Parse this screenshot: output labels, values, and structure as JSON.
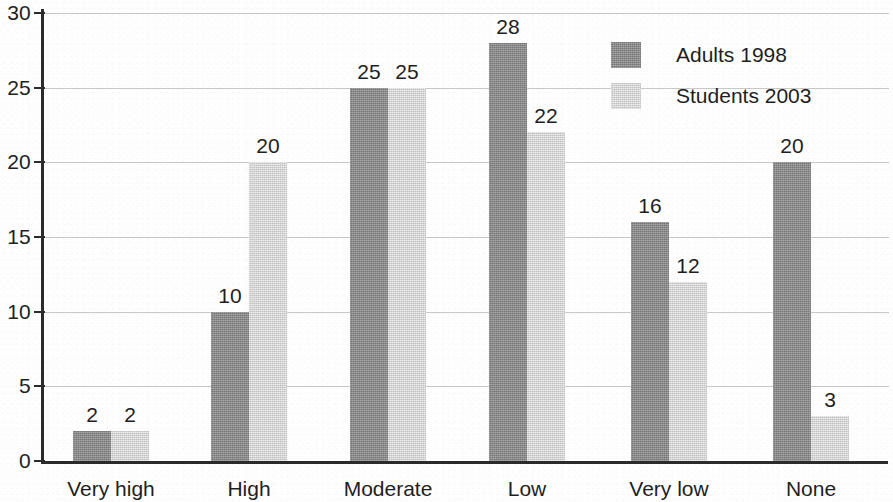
{
  "chart_data": {
    "type": "bar",
    "title": "",
    "xlabel": "",
    "ylabel": "",
    "grid": true,
    "legend_position": "top-right",
    "ylim": [
      0,
      30
    ],
    "yticks": [
      0,
      5,
      10,
      15,
      20,
      25,
      30
    ],
    "ytick_labels": [
      "0",
      "5",
      "10",
      "15",
      "20",
      "25",
      "30"
    ],
    "categories": [
      "Very high",
      "High",
      "Moderate",
      "Low",
      "Very low",
      "None"
    ],
    "series": [
      {
        "name": "Adults 1998",
        "color": "#8d8d8d",
        "values": [
          2,
          10,
          25,
          28,
          16,
          20
        ],
        "value_labels": [
          "2",
          "10",
          "25",
          "28",
          "16",
          "20"
        ]
      },
      {
        "name": "Students 2003",
        "color": "#dcdcdc",
        "values": [
          2,
          20,
          25,
          22,
          12,
          3
        ],
        "value_labels": [
          "2",
          "20",
          "25",
          "22",
          "12",
          "3"
        ]
      }
    ]
  },
  "axis": {
    "line_color": "#2b2b2b",
    "gridline_color": "#c9c9c9"
  },
  "legend": {
    "entries": [
      {
        "label": "Adults 1998",
        "swatch": "dark"
      },
      {
        "label": "Students 2003",
        "swatch": "light"
      }
    ]
  }
}
